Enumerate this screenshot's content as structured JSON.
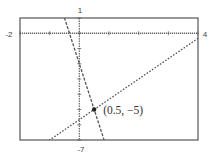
{
  "chart_data": {
    "type": "line",
    "title": "",
    "xlabel": "",
    "ylabel": "",
    "xlim": [
      -2,
      4
    ],
    "ylim": [
      -7,
      1
    ],
    "xscale_ticks": 1,
    "yscale_ticks": 1,
    "window_labels": {
      "xmin": "-2",
      "xmax": "4",
      "ymax": "1",
      "ymin": "-7"
    },
    "grid": false,
    "legend": "none",
    "series": [
      {
        "name": "y = -6x - 2",
        "slope": -6,
        "intercept": -2,
        "x": [
          -2,
          4
        ],
        "style": "dashed"
      },
      {
        "name": "y = (4/3)x - 17/3",
        "slope": 1.3333,
        "intercept": -5.6667,
        "x": [
          -2,
          4
        ],
        "style": "dotted"
      }
    ],
    "annotations": [
      {
        "x": 0.5,
        "y": -5,
        "text": "(0.5, −5)",
        "marker": "point"
      }
    ]
  },
  "colors": {
    "frame": "#555555",
    "axes": "#666666",
    "lines": "#555555",
    "point": "#222222"
  }
}
